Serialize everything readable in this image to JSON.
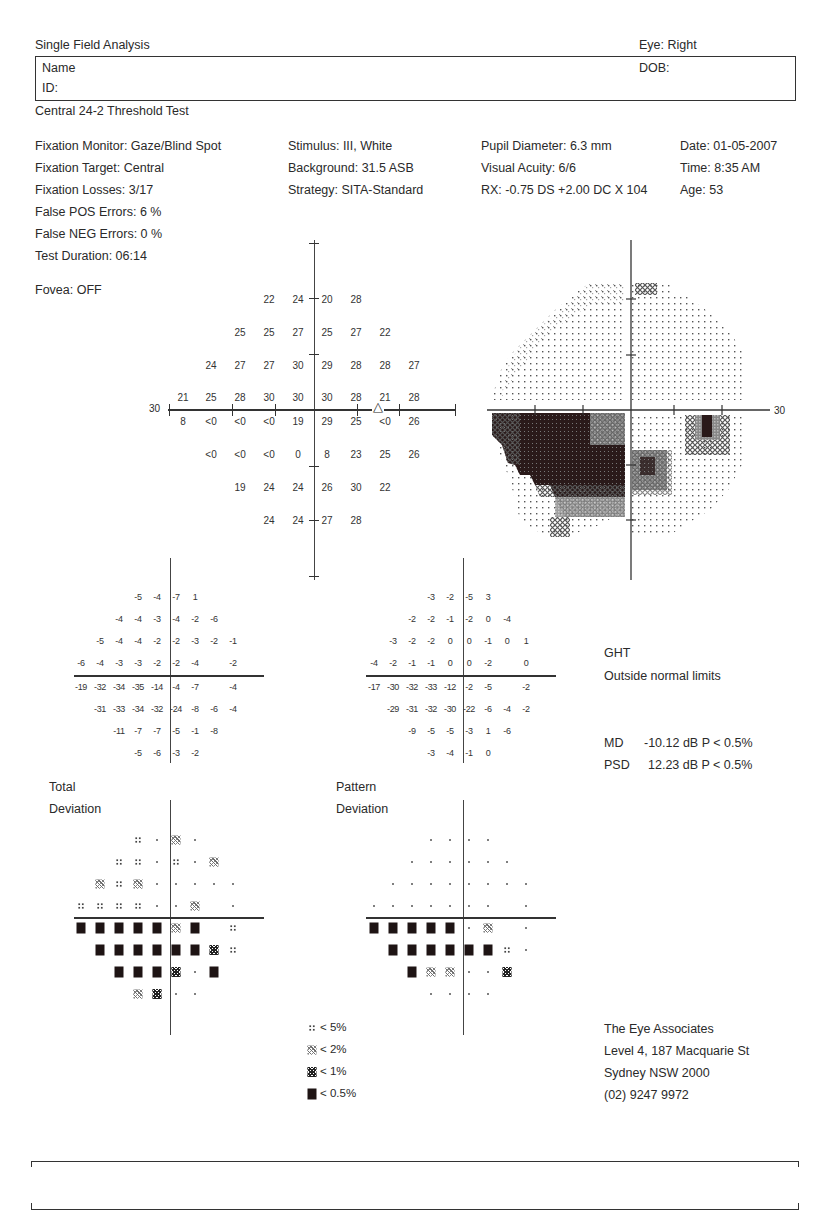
{
  "header": {
    "title": "Single Field Analysis",
    "eye": "Eye: Right",
    "name_label": "Name",
    "id_label": "ID:",
    "dob_label": "DOB:",
    "test_name": "Central 24-2 Threshold Test"
  },
  "test_params": {
    "col1": [
      "Fixation Monitor: Gaze/Blind Spot",
      "Fixation Target: Central",
      "Fixation Losses: 3/17",
      "False POS Errors:  6 %",
      "False NEG Errors:  0 %",
      "Test Duration: 06:14"
    ],
    "fovea": "Fovea: OFF",
    "col2": [
      "Stimulus: III, White",
      "Background: 31.5 ASB",
      "Strategy: SITA-Standard"
    ],
    "col3": [
      "Pupil Diameter: 6.3 mm",
      "Visual Acuity: 6/6",
      "RX: -0.75 DS  +2.00 DC  X 104"
    ],
    "col4": [
      "Date: 01-05-2007",
      "Time:  8:35 AM",
      "Age: 53"
    ]
  },
  "threshold_plot": {
    "axis_label": "30",
    "rows": [
      [
        "",
        "",
        "",
        "22",
        "24",
        "20",
        "28",
        "",
        ""
      ],
      [
        "",
        "",
        "25",
        "25",
        "27",
        "25",
        "27",
        "22",
        ""
      ],
      [
        "",
        "24",
        "27",
        "27",
        "30",
        "29",
        "28",
        "28",
        "27"
      ],
      [
        "21",
        "25",
        "28",
        "30",
        "30",
        "30",
        "28",
        "21",
        "28"
      ],
      [
        "8",
        "<0",
        "<0",
        "<0",
        "19",
        "29",
        "25",
        "<0",
        "26"
      ],
      [
        "",
        "<0",
        "<0",
        "<0",
        "0",
        "8",
        "23",
        "25",
        "26"
      ],
      [
        "",
        "",
        "19",
        "24",
        "24",
        "26",
        "30",
        "22",
        ""
      ],
      [
        "",
        "",
        "",
        "24",
        "24",
        "27",
        "28",
        "",
        ""
      ]
    ],
    "blind_spot_marker": "triangle"
  },
  "greyscale_plot": {
    "axis_label": "30"
  },
  "total_deviation": {
    "label_line1": "Total",
    "label_line2": "Deviation",
    "rows": [
      [
        "",
        "",
        "",
        "-5",
        "-4",
        "-7",
        "1",
        "",
        ""
      ],
      [
        "",
        "",
        "-4",
        "-4",
        "-3",
        "-4",
        "-2",
        "-6",
        ""
      ],
      [
        "",
        "-5",
        "-4",
        "-4",
        "-2",
        "-2",
        "-3",
        "-2",
        "-1"
      ],
      [
        "-6",
        "-4",
        "-3",
        "-3",
        "-2",
        "-2",
        "-4",
        "",
        "-2"
      ],
      [
        "-19",
        "-32",
        "-34",
        "-35",
        "-14",
        "-4",
        "-7",
        "",
        "-4"
      ],
      [
        "",
        "-31",
        "-33",
        "-34",
        "-32",
        "-24",
        "-8",
        "-6",
        "-4"
      ],
      [
        "",
        "",
        "-11",
        "-7",
        "-7",
        "-5",
        "-1",
        "-8",
        ""
      ],
      [
        "",
        "",
        "",
        "-5",
        "-6",
        "-3",
        "-2",
        "",
        ""
      ]
    ],
    "prob_rows": [
      [
        "",
        "",
        "",
        "p5",
        "dot",
        "p2",
        "dot",
        "",
        ""
      ],
      [
        "",
        "",
        "p5",
        "p5",
        "dot",
        "p5",
        "dot",
        "p2",
        ""
      ],
      [
        "",
        "p2",
        "p5",
        "p2",
        "dot",
        "dot",
        "dot",
        "dot",
        "dot"
      ],
      [
        "p5",
        "p5",
        "p5",
        "p5",
        "dot",
        "dot",
        "p2",
        "",
        "dot"
      ],
      [
        "p05",
        "p05",
        "p05",
        "p05",
        "p05",
        "p2",
        "p05",
        "",
        "p5"
      ],
      [
        "",
        "p05",
        "p05",
        "p05",
        "p05",
        "p05",
        "p05",
        "p1",
        "p5"
      ],
      [
        "",
        "",
        "p05",
        "p05",
        "p05",
        "p1",
        "dot",
        "p05",
        ""
      ],
      [
        "",
        "",
        "",
        "p2",
        "p1",
        "dot",
        "dot",
        "",
        ""
      ]
    ]
  },
  "pattern_deviation": {
    "label_line1": "Pattern",
    "label_line2": "Deviation",
    "rows": [
      [
        "",
        "",
        "",
        "-3",
        "-2",
        "-5",
        "3",
        "",
        ""
      ],
      [
        "",
        "",
        "-2",
        "-2",
        "-1",
        "-2",
        "0",
        "-4",
        ""
      ],
      [
        "",
        "-3",
        "-2",
        "-2",
        "0",
        "0",
        "-1",
        "0",
        "1"
      ],
      [
        "-4",
        "-2",
        "-1",
        "-1",
        "0",
        "0",
        "-2",
        "",
        "0"
      ],
      [
        "-17",
        "-30",
        "-32",
        "-33",
        "-12",
        "-2",
        "-5",
        "",
        "-2"
      ],
      [
        "",
        "-29",
        "-31",
        "-32",
        "-30",
        "-22",
        "-6",
        "-4",
        "-2"
      ],
      [
        "",
        "",
        "-9",
        "-5",
        "-5",
        "-3",
        "1",
        "-6",
        ""
      ],
      [
        "",
        "",
        "",
        "-3",
        "-4",
        "-1",
        "0",
        "",
        ""
      ]
    ],
    "prob_rows": [
      [
        "",
        "",
        "",
        "dot",
        "dot",
        "dot",
        "dot",
        "",
        ""
      ],
      [
        "",
        "",
        "dot",
        "dot",
        "dot",
        "dot",
        "dot",
        "dot",
        ""
      ],
      [
        "",
        "dot",
        "dot",
        "dot",
        "dot",
        "dot",
        "dot",
        "dot",
        "dot"
      ],
      [
        "dot",
        "dot",
        "dot",
        "dot",
        "dot",
        "dot",
        "dot",
        "",
        "dot"
      ],
      [
        "p05",
        "p05",
        "p05",
        "p05",
        "p05",
        "dot",
        "p2",
        "",
        "dot"
      ],
      [
        "",
        "p05",
        "p05",
        "p05",
        "p05",
        "p05",
        "p05",
        "p5",
        "dot"
      ],
      [
        "",
        "",
        "p05",
        "p2",
        "p2",
        "dot",
        "dot",
        "p1",
        ""
      ],
      [
        "",
        "",
        "",
        "dot",
        "dot",
        "dot",
        "dot",
        "",
        ""
      ]
    ]
  },
  "indices": {
    "ght_label": "GHT",
    "ght_value": "Outside normal limits",
    "md_label": "MD",
    "md_value": "-10.12 dB  P < 0.5%",
    "psd_label": "PSD",
    "psd_value": "12.23 dB  P < 0.5%"
  },
  "legend": [
    {
      "symbol": "p5",
      "label": "< 5%"
    },
    {
      "symbol": "p2",
      "label": "< 2%"
    },
    {
      "symbol": "p1",
      "label": "< 1%"
    },
    {
      "symbol": "p05",
      "label": "< 0.5%"
    }
  ],
  "clinic": {
    "name": "The Eye Associates",
    "address1": "Level 4, 187 Macquarie St",
    "address2": "Sydney NSW 2000",
    "phone": "(02) 9247 9972"
  }
}
